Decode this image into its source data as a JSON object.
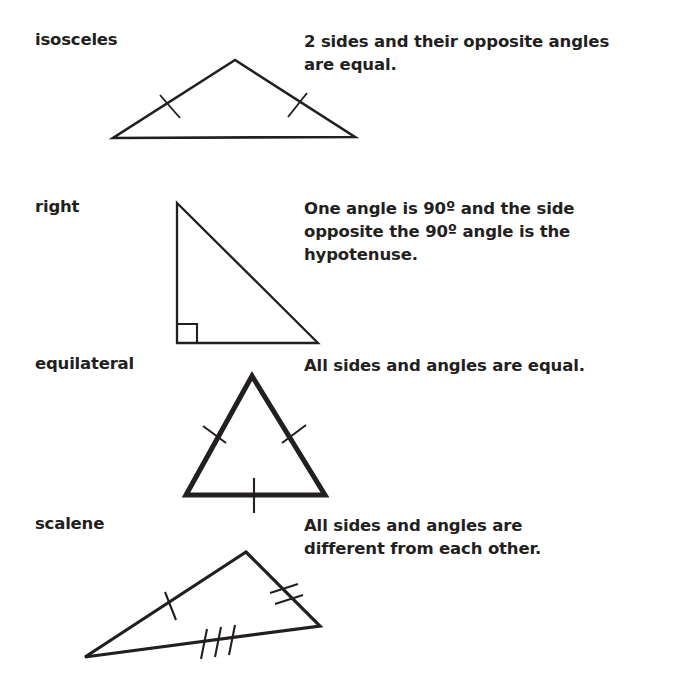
{
  "page": {
    "background_color": "#ffffff",
    "ink_color": "#231f20"
  },
  "rows": [
    {
      "id": "isosceles",
      "label": "isosceles",
      "description": "2 sides and their opposite angles\nare equal.",
      "figure": {
        "name": "isosceles-triangle",
        "stroke_width": 2.6,
        "vertices": [
          [
            122,
            10
          ],
          [
            122,
            10
          ]
        ],
        "tick_marks": [
          {
            "side": "left",
            "count": 1
          },
          {
            "side": "right",
            "count": 1
          }
        ]
      }
    },
    {
      "id": "right",
      "label": "right",
      "description": "One angle is 90º and the side\nopposite the 90º angle is the\nhypotenuse.",
      "figure": {
        "name": "right-triangle",
        "stroke_width": 2.3,
        "right_angle_marker": true,
        "tick_marks": []
      }
    },
    {
      "id": "equilateral",
      "label": "equilateral",
      "description": "All sides and angles are equal.",
      "figure": {
        "name": "equilateral-triangle",
        "stroke_width": 5.0,
        "tick_marks": [
          {
            "side": "left",
            "count": 1
          },
          {
            "side": "right",
            "count": 1
          },
          {
            "side": "bottom",
            "count": 1
          }
        ]
      }
    },
    {
      "id": "scalene",
      "label": "scalene",
      "description": "All sides and angles are\ndifferent from each other.",
      "figure": {
        "name": "scalene-triangle",
        "stroke_width": 3.2,
        "tick_marks": [
          {
            "side": "upper-left",
            "count": 1
          },
          {
            "side": "right",
            "count": 2
          },
          {
            "side": "bottom",
            "count": 3
          }
        ]
      }
    }
  ]
}
